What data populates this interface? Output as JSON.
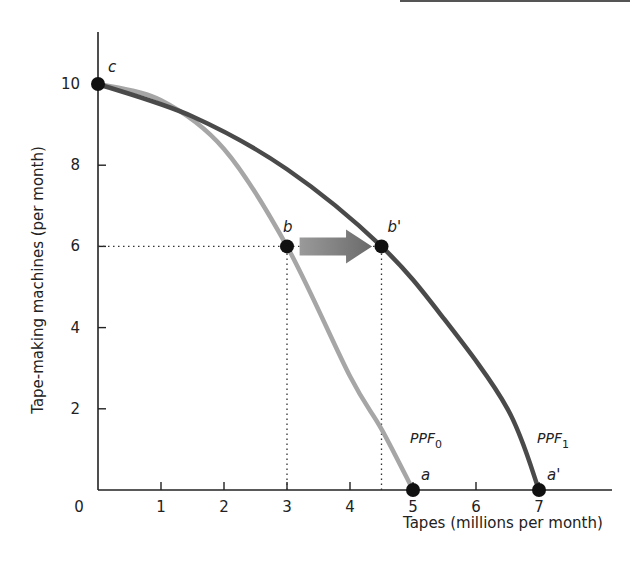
{
  "chart_data": {
    "type": "line",
    "title": "",
    "xlabel": "Tapes (millions per month)",
    "ylabel": "Tape-making machines (per month)",
    "xlim": [
      0,
      8
    ],
    "ylim": [
      0,
      11
    ],
    "grid": false,
    "x_ticks": [
      "0",
      "1",
      "2",
      "3",
      "4",
      "5",
      "6",
      "7"
    ],
    "y_ticks": [
      "2",
      "4",
      "6",
      "8",
      "10"
    ],
    "series": [
      {
        "name": "PPF0",
        "label_main": "PPF",
        "label_sub": "0",
        "color": "#a6a6a6",
        "points": [
          [
            0,
            10
          ],
          [
            1,
            9.6
          ],
          [
            2,
            8.4
          ],
          [
            3,
            6
          ],
          [
            4,
            2.8
          ],
          [
            4.5,
            1.5
          ],
          [
            5,
            0
          ]
        ]
      },
      {
        "name": "PPF1",
        "label_main": "PPF",
        "label_sub": "1",
        "color": "#4a4a4a",
        "points": [
          [
            0,
            10
          ],
          [
            1.5,
            9.2
          ],
          [
            3,
            7.9
          ],
          [
            4.5,
            6
          ],
          [
            5.5,
            4.2
          ],
          [
            6.5,
            2
          ],
          [
            7,
            0
          ]
        ]
      }
    ],
    "labeled_points": [
      {
        "label": "c",
        "x": 0,
        "y": 10
      },
      {
        "label": "b",
        "x": 3,
        "y": 6
      },
      {
        "label": "b'",
        "x": 4.5,
        "y": 6
      },
      {
        "label": "a",
        "x": 5,
        "y": 0
      },
      {
        "label": "a'",
        "x": 7,
        "y": 0
      }
    ],
    "annotations": [
      {
        "type": "arrow",
        "from": [
          3.2,
          6
        ],
        "to": [
          4.35,
          6
        ],
        "color": "#777777",
        "meaning": "outward shift from b to b'"
      },
      {
        "type": "dotted-guide",
        "from": [
          0,
          6
        ],
        "to": [
          4.5,
          6
        ]
      },
      {
        "type": "dotted-guide",
        "from": [
          3,
          0
        ],
        "to": [
          3,
          6
        ]
      },
      {
        "type": "dotted-guide",
        "from": [
          4.5,
          0
        ],
        "to": [
          4.5,
          6
        ]
      }
    ]
  }
}
